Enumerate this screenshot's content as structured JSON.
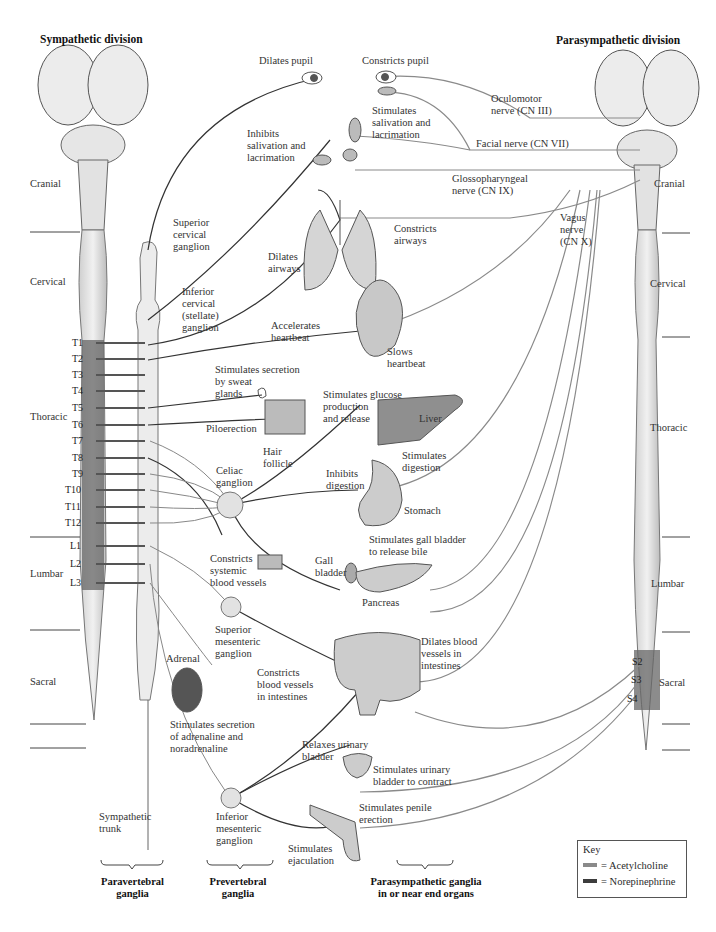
{
  "titles": {
    "sympathetic": "Sympathetic division",
    "parasympathetic": "Parasympathetic division"
  },
  "regions_left": {
    "cranial": "Cranial",
    "cervical": "Cervical",
    "thoracic": "Thoracic",
    "lumbar": "Lumbar",
    "sacral": "Sacral"
  },
  "regions_right": {
    "cranial": "Cranial",
    "cervical": "Cervical",
    "thoracic": "Thoracic",
    "lumbar": "Lumbar",
    "sacral": "Sacral"
  },
  "spinal_segments": [
    "T1",
    "T2",
    "T3",
    "T4",
    "T5",
    "T6",
    "T7",
    "T8",
    "T9",
    "T10",
    "T11",
    "T12",
    "L1",
    "L2",
    "L3"
  ],
  "sacral_segments": [
    "S2",
    "S3",
    "S4"
  ],
  "cranial_nerves": {
    "oculomotor": "Oculomotor\nnerve (CN III)",
    "facial": "Facial nerve (CN VII)",
    "glossopharyngeal": "Glossopharyngeal\nnerve (CN IX)",
    "vagus": "Vagus\nnerve\n(CN X)"
  },
  "ganglia": {
    "superior_cervical": "Superior\ncervical\nganglion",
    "inferior_cervical": "Inferior\ncervical\n(stellate)\nganglion",
    "celiac": "Celiac\nganglion",
    "superior_mesenteric": "Superior\nmesenteric\nganglion",
    "inferior_mesenteric": "Inferior\nmesenteric\nganglion",
    "sympathetic_trunk": "Sympathetic\ntrunk"
  },
  "effects": {
    "dilates_pupil": "Dilates pupil",
    "constricts_pupil": "Constricts pupil",
    "stim_salivation": "Stimulates\nsalivation and\nlacrimation",
    "inhib_salivation": "Inhibits\nsalivation and\nlacrimation",
    "constricts_airways": "Constricts\nairways",
    "dilates_airways": "Dilates\nairways",
    "accelerates_heartbeat": "Accelerates\nheartbeat",
    "slows_heartbeat": "Slows\nheartbeat",
    "sweat": "Stimulates secretion\nby sweat\nglands",
    "piloerection": "Piloerection",
    "hair_follicle": "Hair\nfollicle",
    "glucose": "Stimulates glucose\nproduction\nand release",
    "liver": "Liver",
    "stim_digestion": "Stimulates\ndigestion",
    "inhib_digestion": "Inhibits\ndigestion",
    "stomach": "Stomach",
    "constricts_systemic": "Constricts\nsystemic\nblood vessels",
    "gall_bladder": "Gall\nbladder",
    "gall_bile": "Stimulates gall bladder\nto release bile",
    "pancreas": "Pancreas",
    "dilates_intestine_vessels": "Dilates blood\nvessels in\nintestines",
    "constricts_intestine_vessels": "Constricts\nblood vessels\nin intestines",
    "adrenal": "Adrenal",
    "adrenal_secretion": "Stimulates secretion\nof adrenaline and\nnoradrenaline",
    "relaxes_bladder": "Relaxes urinary\nbladder",
    "contract_bladder": "Stimulates urinary\nbladder to contract",
    "penile_erection": "Stimulates penile\nerection",
    "ejaculation": "Stimulates\nejaculation"
  },
  "footer": {
    "paravertebral": "Paravertebral\nganglia",
    "prevertebral": "Prevertebral\nganglia",
    "parasympathetic_ganglia": "Parasympathetic ganglia\nin or near end organs"
  },
  "key": {
    "title": "Key",
    "acetylcholine": "= Acetylcholine",
    "norepinephrine": "= Norepinephrine",
    "ach_color": "#8a8a8a",
    "ne_color": "#3c3c3c"
  }
}
